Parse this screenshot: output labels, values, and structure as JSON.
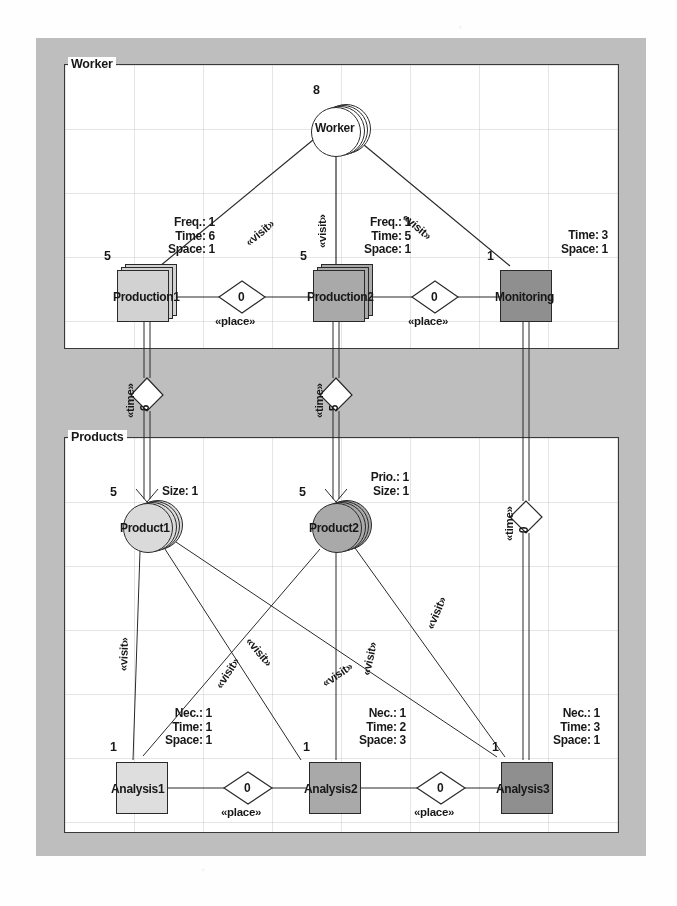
{
  "diagram": {
    "canvas_color": "#bdbdbd",
    "packages": [
      {
        "id": "worker",
        "label": "Worker"
      },
      {
        "id": "products",
        "label": "Products"
      }
    ],
    "nodes": [
      {
        "id": "worker",
        "label": "Worker",
        "shape": "circle",
        "stacked": true,
        "fill": "#ffffff",
        "multiplicity": "8",
        "attrs": []
      },
      {
        "id": "production1",
        "label": "Production1",
        "shape": "square",
        "stacked": true,
        "fill": "#d0d0d0",
        "multiplicity": "5",
        "attrs": [
          "Freq.: 1",
          "Time: 6",
          "Space: 1"
        ]
      },
      {
        "id": "production2",
        "label": "Production2",
        "shape": "square",
        "stacked": true,
        "fill": "#a8a8a8",
        "multiplicity": "5",
        "attrs": [
          "Freq.: 1",
          "Time: 5",
          "Space: 1"
        ]
      },
      {
        "id": "monitoring",
        "label": "Monitoring",
        "shape": "square",
        "stacked": false,
        "fill": "#8f8f8f",
        "multiplicity": "1",
        "attrs": [
          "Time: 3",
          "Space: 1"
        ]
      },
      {
        "id": "product1",
        "label": "Product1",
        "shape": "circle",
        "stacked": true,
        "fill": "#d8d8d8",
        "multiplicity": "5",
        "attrs": [
          "Size: 1"
        ]
      },
      {
        "id": "product2",
        "label": "Product2",
        "shape": "circle",
        "stacked": true,
        "fill": "#a8a8a8",
        "multiplicity": "5",
        "attrs": [
          "Prio.: 1",
          "Size: 1"
        ]
      },
      {
        "id": "analysis1",
        "label": "Analysis1",
        "shape": "square",
        "stacked": false,
        "fill": "#dcdcdc",
        "multiplicity": "1",
        "attrs": [
          "Nec.: 1",
          "Time: 1",
          "Space: 1"
        ]
      },
      {
        "id": "analysis2",
        "label": "Analysis2",
        "shape": "square",
        "stacked": false,
        "fill": "#a8a8a8",
        "multiplicity": "1",
        "attrs": [
          "Nec.: 1",
          "Time: 2",
          "Space: 3"
        ]
      },
      {
        "id": "analysis3",
        "label": "Analysis3",
        "shape": "square",
        "stacked": false,
        "fill": "#8f8f8f",
        "multiplicity": "1",
        "attrs": [
          "Nec.: 1",
          "Time: 3",
          "Space: 1"
        ]
      }
    ],
    "connectors": [
      {
        "id": "visit-worker-production1",
        "stereotype": "«visit»",
        "from": "worker",
        "to": "production1"
      },
      {
        "id": "visit-worker-production2",
        "stereotype": "«visit»",
        "from": "worker",
        "to": "production2"
      },
      {
        "id": "visit-worker-monitoring",
        "stereotype": "«visit»",
        "from": "worker",
        "to": "monitoring"
      },
      {
        "id": "place-prod1-prod2",
        "stereotype": "«place»",
        "value": "0",
        "from": "production1",
        "to": "production2"
      },
      {
        "id": "place-prod2-monitoring",
        "stereotype": "«place»",
        "value": "0",
        "from": "production2",
        "to": "monitoring"
      },
      {
        "id": "time-prod1-product1",
        "stereotype": "«time»",
        "value": "6",
        "from": "production1",
        "to": "product1"
      },
      {
        "id": "time-prod2-product2",
        "stereotype": "«time»",
        "value": "5",
        "from": "production2",
        "to": "product2"
      },
      {
        "id": "time-monitoring-analysis3",
        "stereotype": "«time»",
        "value": "0",
        "from": "monitoring",
        "to": "analysis3"
      },
      {
        "id": "visit-product1-analysis1",
        "stereotype": "«visit»",
        "from": "product1",
        "to": "analysis1"
      },
      {
        "id": "visit-product1-analysis2",
        "stereotype": "«visit»",
        "from": "product1",
        "to": "analysis2"
      },
      {
        "id": "visit-product1-analysis3",
        "stereotype": "«visit»",
        "from": "product1",
        "to": "analysis3"
      },
      {
        "id": "visit-product2-analysis1",
        "stereotype": "«visit»",
        "from": "product2",
        "to": "analysis1"
      },
      {
        "id": "visit-product2-analysis2",
        "stereotype": "«visit»",
        "from": "product2",
        "to": "analysis2"
      },
      {
        "id": "visit-product2-analysis3",
        "stereotype": "«visit»",
        "from": "product2",
        "to": "analysis3"
      },
      {
        "id": "place-analysis1-analysis2",
        "stereotype": "«place»",
        "value": "0",
        "from": "analysis1",
        "to": "analysis2"
      },
      {
        "id": "place-analysis2-analysis3",
        "stereotype": "«place»",
        "value": "0",
        "from": "analysis2",
        "to": "analysis3"
      }
    ],
    "stereotype_labels": {
      "visit": "«visit»",
      "place": "«place»",
      "time": "«time»"
    }
  }
}
